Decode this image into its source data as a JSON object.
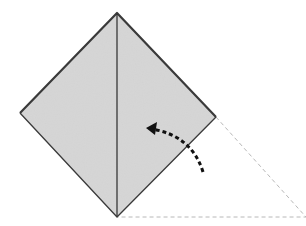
{
  "diagram": {
    "type": "origami-fold-step",
    "colors": {
      "paper_fill": "#d6d6d6",
      "outline": "#3a3a3a",
      "crease": "#2a2a2a",
      "dashed_guide": "#b8b8b8",
      "arrow": "#111111",
      "background": "#ffffff"
    },
    "shape": {
      "top": [
        117,
        13
      ],
      "left": [
        20,
        113
      ],
      "right": [
        216,
        117
      ],
      "bottom": [
        117,
        217
      ]
    },
    "guide_triangle": {
      "from_right": [
        216,
        117
      ],
      "apex": [
        306,
        217
      ],
      "to_bottom": [
        117,
        217
      ]
    },
    "arrow": {
      "style": "dashed-curved",
      "start": [
        203,
        172
      ],
      "control": [
        190,
        134
      ],
      "end": [
        148,
        128
      ],
      "meaning": "fold-up"
    }
  }
}
